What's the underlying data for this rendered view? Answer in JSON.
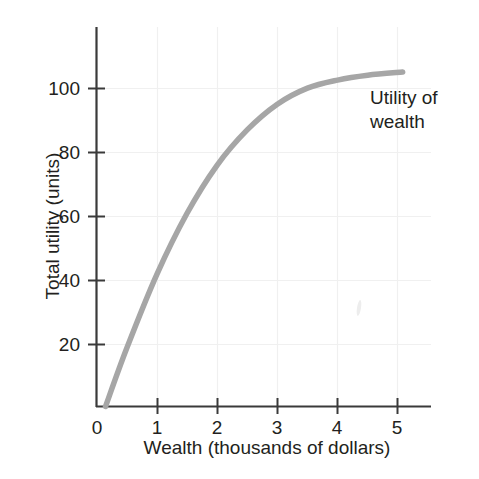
{
  "chart_data": {
    "type": "line",
    "title": "",
    "xlabel": "Wealth (thousands of dollars)",
    "ylabel": "Total utility (units)",
    "xlim": [
      0,
      5.55
    ],
    "ylim": [
      0,
      118
    ],
    "xticks": [
      "0",
      "1",
      "2",
      "3",
      "4",
      "5"
    ],
    "xtick_values": [
      0,
      1,
      2,
      3,
      4,
      5
    ],
    "yticks": [
      "20",
      "40",
      "60",
      "80",
      "100"
    ],
    "ytick_values": [
      20,
      40,
      60,
      80,
      100
    ],
    "grid": true,
    "legend_position": "inline-annotation",
    "series": [
      {
        "name": "Utility of wealth",
        "color": "#a6a6a6",
        "x": [
          0.15,
          0.5,
          1.0,
          1.5,
          2.0,
          2.5,
          3.0,
          3.5,
          4.0,
          4.5,
          5.08
        ],
        "values": [
          0,
          18,
          41,
          60,
          75,
          86,
          94,
          99,
          101.5,
          103,
          104
        ]
      }
    ],
    "annotations": [
      {
        "name": "utility-of-wealth-label",
        "lines": [
          "Utility of",
          "wealth"
        ],
        "x": 4.6,
        "y": 97
      }
    ]
  },
  "axis": {
    "tick_color": "#231f20",
    "grid_color": "#f0f0f0",
    "curve_color": "#a6a6a6"
  }
}
